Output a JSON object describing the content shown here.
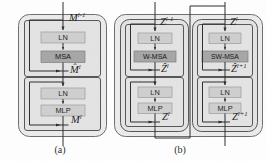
{
  "figure": {
    "type": "diagram",
    "colors": {
      "outer_fill": "#ececec",
      "outer_stroke": "#6d6d6d",
      "inner_fill": "#e4e4e4",
      "inner_stroke": "#555555",
      "ln_fill": "#cfcfcf",
      "ln_stroke": "#9a9a9a",
      "msa_fill": "#a6a6a6",
      "msa_stroke": "#7c7c7c",
      "line": "#2b2b2b",
      "background": "#ffffff"
    }
  },
  "panels": [
    {
      "id": "a",
      "caption": "(a)",
      "blocks": [
        {
          "id": "a-sub1",
          "layers": [
            {
              "name": "LN",
              "style": "ln"
            },
            {
              "name": "MSA",
              "style": "msa"
            }
          ]
        },
        {
          "id": "a-sub2",
          "layers": [
            {
              "name": "LN",
              "style": "ln"
            },
            {
              "name": "MLP",
              "style": "ln"
            }
          ]
        }
      ],
      "signals": [
        {
          "id": "a-in",
          "base": "M",
          "accent": "none",
          "sup": "l-1"
        },
        {
          "id": "a-mid",
          "base": "M",
          "accent": "hat",
          "sup": "l"
        },
        {
          "id": "a-out",
          "base": "M",
          "accent": "none",
          "sup": "l"
        }
      ]
    },
    {
      "id": "b",
      "caption": "(b)",
      "blocks": [
        {
          "id": "b-left-sub1",
          "layers": [
            {
              "name": "LN",
              "style": "ln"
            },
            {
              "name": "W-MSA",
              "style": "msa"
            }
          ]
        },
        {
          "id": "b-left-sub2",
          "layers": [
            {
              "name": "LN",
              "style": "ln"
            },
            {
              "name": "MLP",
              "style": "ln"
            }
          ]
        },
        {
          "id": "b-right-sub1",
          "layers": [
            {
              "name": "LN",
              "style": "ln"
            },
            {
              "name": "SW-MSA",
              "style": "msa"
            }
          ]
        },
        {
          "id": "b-right-sub2",
          "layers": [
            {
              "name": "LN",
              "style": "ln"
            },
            {
              "name": "MLP",
              "style": "ln"
            }
          ]
        }
      ],
      "signals": [
        {
          "id": "b-left-in",
          "base": "Z",
          "accent": "none",
          "sup": "l-1"
        },
        {
          "id": "b-left-mid",
          "base": "Z",
          "accent": "hat",
          "sup": "l"
        },
        {
          "id": "b-left-out",
          "base": "Z",
          "accent": "none",
          "sup": "l"
        },
        {
          "id": "b-right-in",
          "base": "Z",
          "accent": "none",
          "sup": "l"
        },
        {
          "id": "b-right-mid",
          "base": "Z",
          "accent": "hat",
          "sup": "l+1"
        },
        {
          "id": "b-right-out",
          "base": "Z",
          "accent": "none",
          "sup": "l+1"
        }
      ]
    }
  ],
  "labels": {
    "a_input": "M",
    "a_input_sup": "l-1",
    "a_mid": "M̂",
    "a_mid_sup": "l",
    "a_output": "M",
    "a_output_sup": "l",
    "b_l_input": "Z",
    "b_l_input_sup": "l-1",
    "b_l_mid": "Ẑ",
    "b_l_mid_sup": "l",
    "b_l_output": "Z",
    "b_l_output_sup": "l",
    "b_r_input": "Z",
    "b_r_input_sup": "l",
    "b_r_mid": "Ẑ",
    "b_r_mid_sup": "l+1",
    "b_r_output": "Z",
    "b_r_output_sup": "l+1",
    "ln": "LN",
    "msa": "MSA",
    "mlp": "MLP",
    "w_msa": "W-MSA",
    "sw_msa": "SW-MSA",
    "caption_a": "(a)",
    "caption_b": "(b)"
  }
}
